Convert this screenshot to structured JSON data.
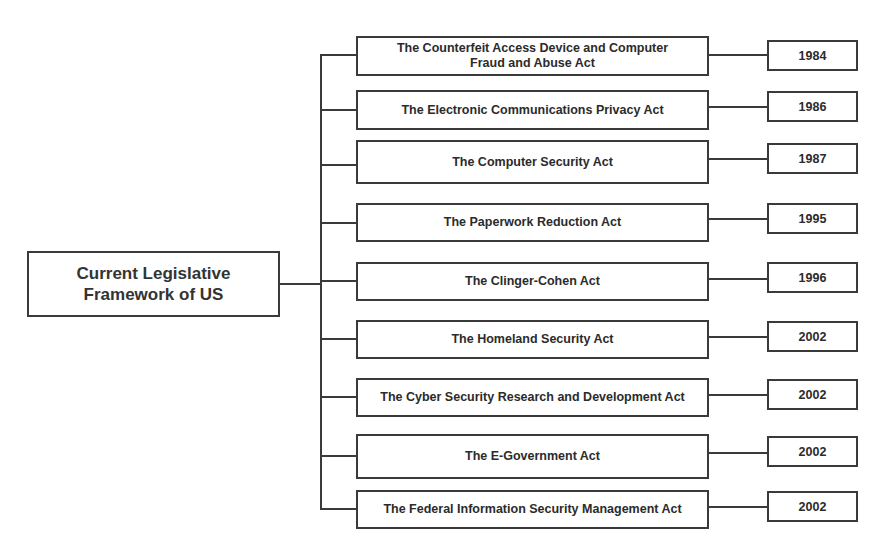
{
  "diagram": {
    "root": {
      "label_line1": "Current Legislative",
      "label_line2": "Framework of US"
    },
    "acts": [
      {
        "name_line1": "The Counterfeit Access Device and Computer",
        "name_line2": "Fraud and Abuse Act",
        "year": "1984"
      },
      {
        "name_line1": "The Electronic Communications Privacy Act",
        "name_line2": "",
        "year": "1986"
      },
      {
        "name_line1": "The Computer Security Act",
        "name_line2": "",
        "year": "1987"
      },
      {
        "name_line1": "The Paperwork Reduction Act",
        "name_line2": "",
        "year": "1995"
      },
      {
        "name_line1": "The Clinger-Cohen Act",
        "name_line2": "",
        "year": "1996"
      },
      {
        "name_line1": "The Homeland Security Act",
        "name_line2": "",
        "year": "2002"
      },
      {
        "name_line1": "The Cyber Security Research and Development Act",
        "name_line2": "",
        "year": "2002"
      },
      {
        "name_line1": "The E-Government Act",
        "name_line2": "",
        "year": "2002"
      },
      {
        "name_line1": "The Federal Information Security Management Act",
        "name_line2": "",
        "year": "2002"
      }
    ]
  }
}
